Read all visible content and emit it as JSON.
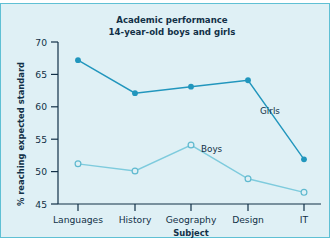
{
  "figure": {
    "background_color": "#dff0f5",
    "border_color": "#5fc0d4",
    "page_background": "#ffffff"
  },
  "chart_data": {
    "type": "line",
    "title": "Academic performance",
    "subtitle": "14-year-old boys and girls",
    "xlabel": "Subject",
    "ylabel": "% reaching expected standard",
    "categories": [
      "Languages",
      "History",
      "Geography",
      "Design",
      "IT"
    ],
    "ylim": [
      45,
      70
    ],
    "yticks": [
      45,
      50,
      55,
      60,
      65,
      70
    ],
    "ytick_labels": [
      "45",
      "50",
      "55",
      "60",
      "65",
      "70"
    ],
    "grid": false,
    "legend_position": "inline-annotations",
    "series": [
      {
        "name": "Girls",
        "values": [
          67.2,
          62.1,
          63.1,
          64.1,
          51.9
        ],
        "color": "#2196bd",
        "marker": "filled-circle",
        "label_text": "Girls"
      },
      {
        "name": "Boys",
        "values": [
          51.2,
          50.1,
          54.1,
          48.9,
          46.8
        ],
        "color": "#7ecbdd",
        "marker": "open-circle",
        "label_text": "Boys"
      }
    ],
    "annotations": [
      {
        "text": "Girls",
        "series": "Girls"
      },
      {
        "text": "Boys",
        "series": "Boys"
      }
    ],
    "axis_color": "#123047"
  }
}
